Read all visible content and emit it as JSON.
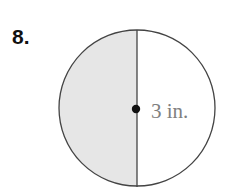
{
  "problem": {
    "number": "8.",
    "figure": {
      "shape": "circle",
      "shaded_portion": "left half",
      "radius_label": "3 in.",
      "colors": {
        "shade": "#e6e6e6",
        "stroke": "#444444",
        "label": "#808080"
      }
    }
  }
}
